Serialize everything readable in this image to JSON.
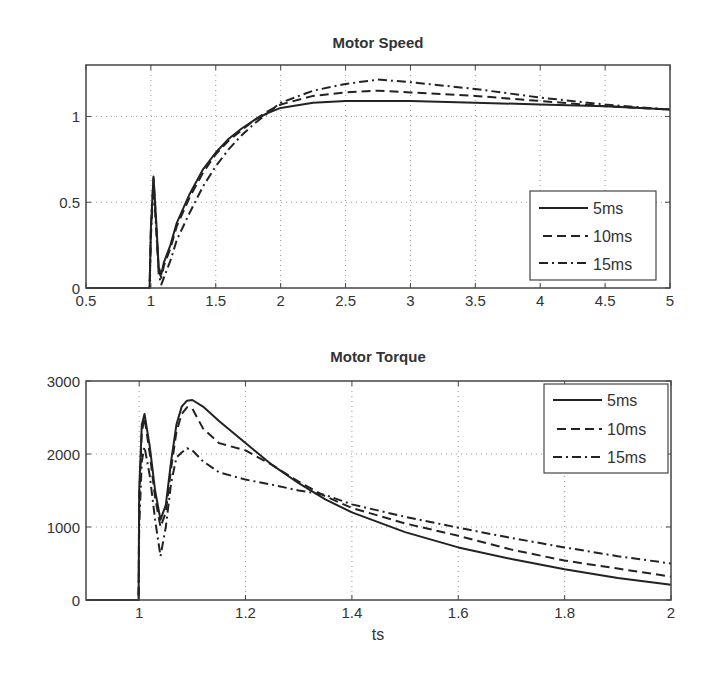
{
  "chart_data": [
    {
      "type": "line",
      "title": "Motor Speed",
      "xlabel": "",
      "ylabel": "",
      "xlim": [
        0.5,
        5
      ],
      "ylim": [
        0,
        1.3
      ],
      "xticks": [
        "0.5",
        "1",
        "1.5",
        "2",
        "2.5",
        "3",
        "3.5",
        "4",
        "4.5",
        "5"
      ],
      "yticks": [
        "0",
        "0.5",
        "1"
      ],
      "grid": true,
      "legend_position": "lower right",
      "x": [
        0.5,
        0.99,
        1.0,
        1.02,
        1.04,
        1.06,
        1.08,
        1.1,
        1.15,
        1.2,
        1.3,
        1.4,
        1.5,
        1.6,
        1.7,
        1.8,
        1.9,
        2.0,
        2.25,
        2.5,
        2.75,
        3.0,
        3.5,
        4.0,
        4.5,
        5.0
      ],
      "series": [
        {
          "name": "5ms",
          "style": "solid",
          "values": [
            0,
            0,
            0.35,
            0.65,
            0.4,
            0.12,
            0.08,
            0.15,
            0.25,
            0.38,
            0.55,
            0.69,
            0.79,
            0.87,
            0.93,
            0.98,
            1.02,
            1.05,
            1.08,
            1.09,
            1.09,
            1.09,
            1.08,
            1.07,
            1.06,
            1.04
          ]
        },
        {
          "name": "10ms",
          "style": "dashed",
          "values": [
            0,
            0,
            0.35,
            0.64,
            0.38,
            0.1,
            0.06,
            0.13,
            0.23,
            0.36,
            0.53,
            0.67,
            0.78,
            0.86,
            0.92,
            0.98,
            1.03,
            1.07,
            1.12,
            1.14,
            1.15,
            1.14,
            1.12,
            1.09,
            1.06,
            1.04
          ]
        },
        {
          "name": "15ms",
          "style": "dashdot",
          "values": [
            0,
            0,
            0.3,
            0.6,
            0.35,
            0.08,
            0.02,
            0.06,
            0.16,
            0.28,
            0.44,
            0.59,
            0.71,
            0.81,
            0.89,
            0.96,
            1.02,
            1.08,
            1.15,
            1.19,
            1.215,
            1.2,
            1.16,
            1.11,
            1.07,
            1.04
          ]
        }
      ],
      "legend": [
        "5ms",
        "10ms",
        "15ms"
      ]
    },
    {
      "type": "line",
      "title": "Motor Torque",
      "xlabel": "ts",
      "ylabel": "",
      "xlim": [
        0.9,
        2
      ],
      "ylim": [
        0,
        3000
      ],
      "xticks": [
        "1",
        "1.2",
        "1.4",
        "1.6",
        "1.8",
        "2"
      ],
      "yticks": [
        "0",
        "1000",
        "2000",
        "3000"
      ],
      "grid": true,
      "legend_position": "upper right",
      "x": [
        0.9,
        0.999,
        1.0,
        1.005,
        1.01,
        1.02,
        1.03,
        1.04,
        1.05,
        1.06,
        1.07,
        1.08,
        1.09,
        1.1,
        1.12,
        1.15,
        1.2,
        1.25,
        1.3,
        1.35,
        1.4,
        1.5,
        1.6,
        1.7,
        1.8,
        1.9,
        2.0
      ],
      "series": [
        {
          "name": "5ms",
          "style": "solid",
          "values": [
            0,
            0,
            1500,
            2400,
            2550,
            2100,
            1500,
            1100,
            1300,
            1900,
            2400,
            2650,
            2730,
            2740,
            2650,
            2450,
            2150,
            1850,
            1600,
            1380,
            1200,
            930,
            720,
            560,
            420,
            300,
            210
          ]
        },
        {
          "name": "10ms",
          "style": "dashed",
          "values": [
            0,
            0,
            1400,
            2300,
            2500,
            2000,
            1400,
            1000,
            1200,
            1800,
            2300,
            2550,
            2640,
            2620,
            2350,
            2150,
            2050,
            1850,
            1620,
            1420,
            1260,
            1050,
            880,
            690,
            540,
            430,
            320
          ]
        },
        {
          "name": "15ms",
          "style": "dashdot",
          "values": [
            0,
            0,
            1000,
            1900,
            2100,
            1700,
            1100,
            600,
            1000,
            1600,
            1950,
            2020,
            2080,
            2050,
            1900,
            1750,
            1650,
            1580,
            1500,
            1440,
            1310,
            1140,
            990,
            850,
            720,
            600,
            500
          ]
        }
      ],
      "legend": [
        "5ms",
        "10ms",
        "15ms"
      ]
    }
  ],
  "top": {
    "title": "Motor Speed",
    "legend": [
      "5ms",
      "10ms",
      "15ms"
    ]
  },
  "bottom": {
    "title": "Motor Torque",
    "xlabel": "ts",
    "legend": [
      "5ms",
      "10ms",
      "15ms"
    ]
  }
}
